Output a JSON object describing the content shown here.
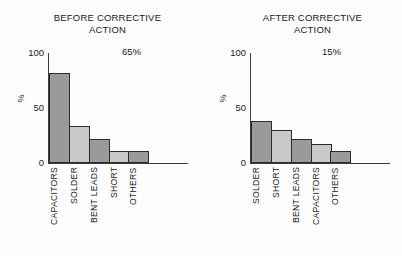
{
  "chart_data": [
    {
      "type": "bar",
      "title": "BEFORE CORRECTIVE\nACTION",
      "annotation": "65%",
      "xlabel": "",
      "ylabel": "%",
      "ylim": [
        0,
        100
      ],
      "yticks": [
        "0",
        "50",
        "100"
      ],
      "grid": false,
      "legend": "none",
      "categories": [
        "CAPACITORS",
        "SOLDER",
        "BENT LEADS",
        "SHORT",
        "OTHERS"
      ],
      "values": [
        82,
        34,
        22,
        11,
        11
      ],
      "bar_colors": [
        "#9a9a9a",
        "#c9c9c9",
        "#9a9a9a",
        "#c9c9c9",
        "#9a9a9a"
      ],
      "bar_edge_color": "#2b2b2b"
    },
    {
      "type": "bar",
      "title": "AFTER CORRECTIVE\nACTION",
      "annotation": "15%",
      "xlabel": "",
      "ylabel": "%",
      "ylim": [
        0,
        100
      ],
      "yticks": [
        "0",
        "50",
        "100"
      ],
      "grid": false,
      "legend": "none",
      "categories": [
        "SOLDER",
        "SHORT",
        "BENT LEADS",
        "CAPACITORS",
        "OTHERS"
      ],
      "values": [
        38,
        30,
        22,
        17,
        11
      ],
      "bar_colors": [
        "#9a9a9a",
        "#c9c9c9",
        "#9a9a9a",
        "#c9c9c9",
        "#9a9a9a"
      ],
      "bar_edge_color": "#2b2b2b"
    }
  ],
  "figure": {
    "background": "#fdfdfd",
    "text_color": "#1a1a1a",
    "axis_color": "#3a3a3a"
  }
}
